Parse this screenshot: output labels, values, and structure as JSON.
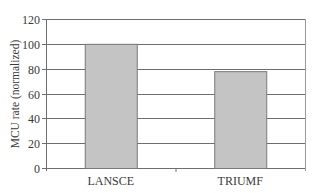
{
  "chart_data": {
    "type": "bar",
    "title": "",
    "xlabel": "",
    "ylabel": "MCU rate (normalized)",
    "categories": [
      "LANSCE",
      "TRIUMF"
    ],
    "values": [
      100,
      78
    ],
    "ylim": [
      0,
      120
    ],
    "yticks": [
      0,
      20,
      40,
      60,
      80,
      100,
      120
    ],
    "grid": true,
    "legend": null,
    "bar_color": "#c4c4c4",
    "bar_edge_color": "#7a7a7a",
    "grid_color": "#6e6e6e"
  }
}
